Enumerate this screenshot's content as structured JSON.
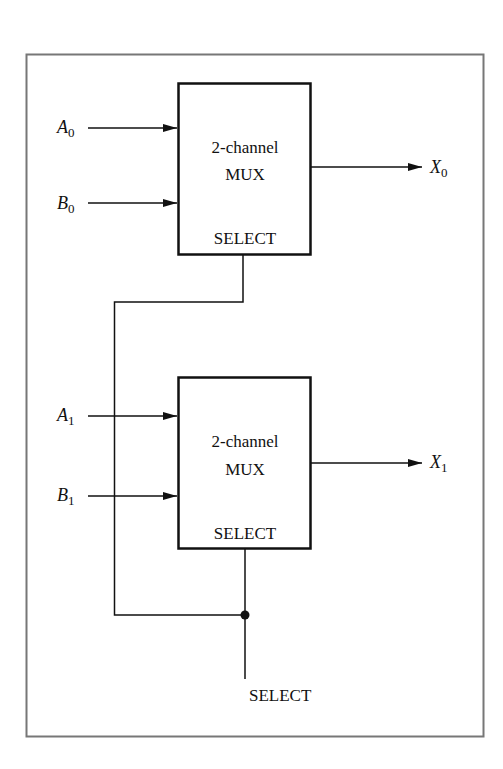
{
  "diagram": {
    "frame_color": "#777777",
    "line_color": "#111111",
    "mux_top": {
      "title": "2-channel",
      "subtitle": "MUX",
      "select_label": "SELECT",
      "inputs": [
        {
          "letter": "A",
          "index": "0"
        },
        {
          "letter": "B",
          "index": "0"
        }
      ],
      "output": {
        "letter": "X",
        "index": "0"
      }
    },
    "mux_bottom": {
      "title": "2-channel",
      "subtitle": "MUX",
      "select_label": "SELECT",
      "inputs": [
        {
          "letter": "A",
          "index": "1"
        },
        {
          "letter": "B",
          "index": "1"
        }
      ],
      "output": {
        "letter": "X",
        "index": "1"
      }
    },
    "common_select_label": "SELECT"
  }
}
